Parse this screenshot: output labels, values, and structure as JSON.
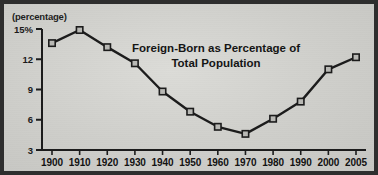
{
  "chart_data": {
    "type": "line",
    "title": "Foreign-Born as Percentage of Total Population",
    "title_line1": "Foreign-Born as Percentage of",
    "title_line2": "Total Population",
    "axis_unit_label": "(percentage)",
    "xlabel": "",
    "ylabel": "",
    "categories": [
      "1900",
      "1910",
      "1920",
      "1930",
      "1940",
      "1950",
      "1960",
      "1970",
      "1980",
      "1990",
      "2000",
      "2005"
    ],
    "values": [
      13.6,
      14.9,
      13.2,
      11.6,
      8.8,
      6.8,
      5.3,
      4.6,
      6.1,
      7.8,
      11.0,
      12.2
    ],
    "ylim": [
      3,
      15
    ],
    "yticks": [
      3,
      6,
      9,
      12,
      15
    ],
    "ytick_labels": [
      "3",
      "6",
      "9",
      "12",
      "15%"
    ],
    "xtick_labels": [
      "1900",
      "1910",
      "1920",
      "1930",
      "1940",
      "1950",
      "1960",
      "1970",
      "1980",
      "1990",
      "2000",
      "2005"
    ],
    "grid": false,
    "legend": false,
    "marker": "open-square",
    "line_color": "#1b1b1b",
    "marker_fill": "#b9b9b5",
    "marker_stroke": "#1b1b1b",
    "background_color": "#d2d2cf",
    "frame_color": "#2e2e2e",
    "text_color": "#161616"
  }
}
